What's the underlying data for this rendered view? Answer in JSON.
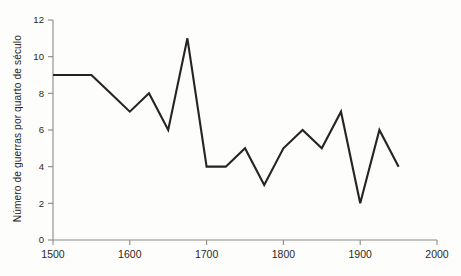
{
  "figure": {
    "background_color": "#fdfdfc",
    "line_color": "#272320",
    "axis_color": "#8d8a86",
    "text_color": "#2a2724"
  },
  "axes": {
    "ylabel": "Número de guerras por quarto de século",
    "xlabel": "",
    "y_ticks": [
      "0",
      "2",
      "4",
      "6",
      "8",
      "10",
      "12"
    ],
    "x_ticks": [
      "1500",
      "1600",
      "1700",
      "1800",
      "1900",
      "2000"
    ]
  },
  "chart_data": {
    "type": "line",
    "title": "",
    "subtitle": "",
    "xlabel": "",
    "ylabel": "Número de guerras por quarto de século",
    "xlim": [
      1500,
      2000
    ],
    "ylim": [
      0,
      12
    ],
    "xtick_values": [
      1500,
      1600,
      1700,
      1800,
      1900,
      2000
    ],
    "ytick_values": [
      0,
      2,
      4,
      6,
      8,
      10,
      12
    ],
    "grid": false,
    "legend": null,
    "legend_position": "none",
    "annotations": [],
    "x_unit": "quarter century (start year)",
    "x": [
      1500,
      1525,
      1550,
      1575,
      1600,
      1625,
      1650,
      1675,
      1700,
      1725,
      1750,
      1775,
      1800,
      1825,
      1850,
      1875,
      1900,
      1925,
      1950
    ],
    "values": [
      9,
      9,
      9,
      8,
      7,
      8,
      6,
      11,
      4,
      4,
      5,
      3,
      5,
      6,
      5,
      7,
      2,
      6,
      4
    ],
    "series": [
      {
        "name": "Número de guerras por quarto de século",
        "x": [
          1500,
          1525,
          1550,
          1575,
          1600,
          1625,
          1650,
          1675,
          1700,
          1725,
          1750,
          1775,
          1800,
          1825,
          1850,
          1875,
          1900,
          1925,
          1950
        ],
        "values": [
          9,
          9,
          9,
          8,
          7,
          8,
          6,
          11,
          4,
          4,
          5,
          3,
          5,
          6,
          5,
          7,
          2,
          6,
          4
        ],
        "color": "#272320"
      }
    ]
  }
}
